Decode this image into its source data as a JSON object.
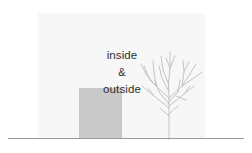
{
  "illustration": {
    "caption": {
      "line1": "inside",
      "line2": "&",
      "line3": "outside"
    },
    "elements": {
      "backdrop_label": "backdrop-panel",
      "volume_label": "gray-volume-block",
      "tree_label": "bare-tree",
      "ground_label": "ground-line"
    },
    "colors": {
      "canvas": "#ffffff",
      "backdrop": "#f7f7f7",
      "volume": "#c9c9c9",
      "ground": "#9a9a9a",
      "tree": "#bdbdbd",
      "text": "#2f2f2f"
    }
  }
}
